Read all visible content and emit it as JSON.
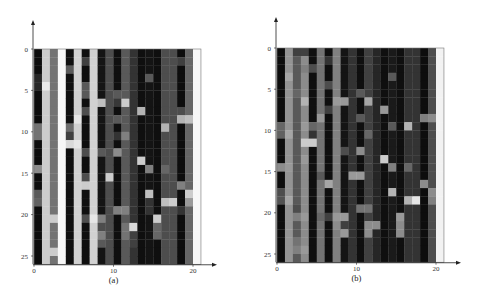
{
  "chart_data": [
    {
      "type": "heatmap",
      "label": "(a)",
      "xticks": [
        "0",
        "10",
        "20"
      ],
      "yticks": [
        "0",
        "5",
        "10",
        "15",
        "20",
        "25"
      ],
      "xlim": [
        0,
        21
      ],
      "ylim": [
        0,
        26
      ],
      "colormap": "grayscale (0 = black, 1 = white)",
      "columns": 21,
      "rows": 26,
      "column_base": [
        0.05,
        0.8,
        0.45,
        0.97,
        0.06,
        0.82,
        0.06,
        0.82,
        0.08,
        0.3,
        0.06,
        0.35,
        0.2,
        0.06,
        0.08,
        0.06,
        0.3,
        0.3,
        0.05,
        0.4,
        0.97
      ],
      "overrides": [
        [
          0,
          9,
          0.45
        ],
        [
          0,
          10,
          0.45
        ],
        [
          0,
          14,
          0.55
        ],
        [
          0,
          17,
          0.35
        ],
        [
          0,
          18,
          0.38
        ],
        [
          0,
          3,
          0.15
        ],
        [
          0,
          4,
          0.15
        ],
        [
          1,
          4,
          0.92
        ],
        [
          2,
          20,
          0.8
        ],
        [
          2,
          24,
          0.8
        ],
        [
          4,
          2,
          0.35
        ],
        [
          4,
          9,
          0.42
        ],
        [
          4,
          10,
          0.25
        ],
        [
          4,
          11,
          0.85
        ],
        [
          5,
          8,
          0.9
        ],
        [
          5,
          11,
          0.9
        ],
        [
          6,
          1,
          0.25
        ],
        [
          6,
          4,
          0.35
        ],
        [
          6,
          5,
          0.35
        ],
        [
          6,
          7,
          0.3
        ],
        [
          6,
          12,
          0.3
        ],
        [
          6,
          15,
          0.3
        ],
        [
          6,
          16,
          0.8
        ],
        [
          6,
          20,
          0.3
        ],
        [
          7,
          20,
          0.9
        ],
        [
          8,
          6,
          0.75
        ],
        [
          8,
          12,
          0.35
        ],
        [
          8,
          20,
          0.5
        ],
        [
          8,
          21,
          0.3
        ],
        [
          8,
          22,
          0.5
        ],
        [
          8,
          23,
          0.35
        ],
        [
          9,
          15,
          0.8
        ],
        [
          10,
          5,
          0.35
        ],
        [
          10,
          6,
          0.22
        ],
        [
          10,
          8,
          0.35
        ],
        [
          10,
          10,
          0.2
        ],
        [
          10,
          12,
          0.55
        ],
        [
          10,
          19,
          0.5
        ],
        [
          11,
          6,
          0.8
        ],
        [
          11,
          10,
          0.5
        ],
        [
          11,
          19,
          0.5
        ],
        [
          11,
          21,
          0.45
        ],
        [
          11,
          22,
          0.45
        ],
        [
          12,
          21,
          0.85
        ],
        [
          12,
          22,
          0.25
        ],
        [
          12,
          23,
          0.25
        ],
        [
          13,
          7,
          0.7
        ],
        [
          13,
          13,
          0.8
        ],
        [
          14,
          3,
          0.35
        ],
        [
          14,
          14,
          0.5
        ],
        [
          14,
          17,
          0.75
        ],
        [
          14,
          18,
          0.2
        ],
        [
          14,
          19,
          0.2
        ],
        [
          15,
          20,
          0.8
        ],
        [
          15,
          21,
          0.4
        ],
        [
          15,
          22,
          0.4
        ],
        [
          16,
          9,
          0.7
        ],
        [
          16,
          14,
          0.4
        ],
        [
          16,
          18,
          0.75
        ],
        [
          17,
          18,
          0.8
        ],
        [
          18,
          1,
          0.25
        ],
        [
          18,
          7,
          0.3
        ],
        [
          18,
          8,
          0.7
        ],
        [
          18,
          16,
          0.5
        ],
        [
          18,
          19,
          0.2
        ],
        [
          19,
          8,
          0.75
        ],
        [
          19,
          17,
          0.8
        ],
        [
          19,
          18,
          0.6
        ]
      ]
    },
    {
      "type": "heatmap",
      "label": "(b)",
      "xticks": [
        "0",
        "10",
        "20"
      ],
      "yticks": [
        "0",
        "5",
        "10",
        "15",
        "20",
        "25"
      ],
      "xlim": [
        0,
        21
      ],
      "ylim": [
        0,
        26
      ],
      "colormap": "grayscale (0 = black, 1 = white)",
      "columns": 21,
      "rows": 26,
      "column_base": [
        0.05,
        0.58,
        0.35,
        0.55,
        0.06,
        0.45,
        0.06,
        0.5,
        0.08,
        0.2,
        0.06,
        0.25,
        0.15,
        0.06,
        0.1,
        0.06,
        0.2,
        0.2,
        0.05,
        0.3,
        0.95
      ],
      "overrides": [
        [
          0,
          9,
          0.4
        ],
        [
          0,
          10,
          0.38
        ],
        [
          0,
          14,
          0.55
        ],
        [
          0,
          17,
          0.3
        ],
        [
          0,
          18,
          0.32
        ],
        [
          1,
          3,
          0.65
        ],
        [
          1,
          10,
          0.65
        ],
        [
          1,
          14,
          0.6
        ],
        [
          1,
          18,
          0.65
        ],
        [
          2,
          0,
          0.25
        ],
        [
          2,
          5,
          0.4
        ],
        [
          2,
          19,
          0.3
        ],
        [
          2,
          20,
          0.5
        ],
        [
          2,
          23,
          0.45
        ],
        [
          2,
          24,
          0.5
        ],
        [
          3,
          0,
          0.25
        ],
        [
          3,
          2,
          0.5
        ],
        [
          3,
          6,
          0.7
        ],
        [
          3,
          9,
          0.6
        ],
        [
          3,
          11,
          0.8
        ],
        [
          3,
          13,
          0.6
        ],
        [
          3,
          20,
          0.6
        ],
        [
          3,
          24,
          0.6
        ],
        [
          4,
          2,
          0.3
        ],
        [
          4,
          9,
          0.4
        ],
        [
          4,
          10,
          0.2
        ],
        [
          4,
          11,
          0.8
        ],
        [
          5,
          8,
          0.6
        ],
        [
          5,
          15,
          0.35
        ],
        [
          5,
          20,
          0.4
        ],
        [
          6,
          1,
          0.2
        ],
        [
          6,
          4,
          0.3
        ],
        [
          6,
          7,
          0.25
        ],
        [
          6,
          16,
          0.65
        ],
        [
          6,
          20,
          0.25
        ],
        [
          7,
          6,
          0.6
        ],
        [
          7,
          20,
          0.6
        ],
        [
          7,
          21,
          0.55
        ],
        [
          8,
          6,
          0.6
        ],
        [
          8,
          12,
          0.3
        ],
        [
          8,
          20,
          0.6
        ],
        [
          8,
          21,
          0.25
        ],
        [
          8,
          22,
          0.6
        ],
        [
          9,
          15,
          0.6
        ],
        [
          9,
          5,
          0.2
        ],
        [
          10,
          5,
          0.35
        ],
        [
          10,
          8,
          0.35
        ],
        [
          10,
          12,
          0.55
        ],
        [
          10,
          15,
          0.6
        ],
        [
          10,
          19,
          0.45
        ],
        [
          11,
          6,
          0.65
        ],
        [
          11,
          10,
          0.4
        ],
        [
          11,
          19,
          0.45
        ],
        [
          11,
          21,
          0.55
        ],
        [
          11,
          22,
          0.55
        ],
        [
          12,
          21,
          0.55
        ],
        [
          13,
          7,
          0.6
        ],
        [
          13,
          13,
          0.8
        ],
        [
          14,
          3,
          0.35
        ],
        [
          14,
          9,
          0.35
        ],
        [
          14,
          14,
          0.5
        ],
        [
          14,
          17,
          0.7
        ],
        [
          15,
          20,
          0.6
        ],
        [
          15,
          21,
          0.55
        ],
        [
          15,
          22,
          0.55
        ],
        [
          16,
          9,
          0.7
        ],
        [
          16,
          14,
          0.4
        ],
        [
          16,
          18,
          0.7
        ],
        [
          17,
          18,
          0.9
        ],
        [
          18,
          8,
          0.5
        ],
        [
          18,
          16,
          0.55
        ],
        [
          19,
          8,
          0.55
        ],
        [
          19,
          17,
          0.55
        ],
        [
          19,
          18,
          0.5
        ]
      ]
    }
  ]
}
